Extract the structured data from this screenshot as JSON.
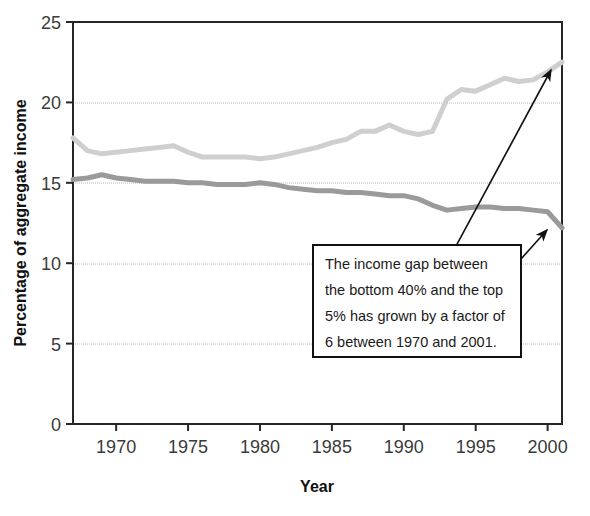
{
  "chart_data": {
    "type": "line",
    "title": "",
    "xlabel": "Year",
    "ylabel": "Percentage of aggregate income",
    "xlim": [
      1967,
      2001
    ],
    "ylim": [
      0,
      25
    ],
    "yticks": [
      0,
      5,
      10,
      15,
      20,
      25
    ],
    "ytick_labels": [
      "0",
      "5",
      "10",
      "15",
      "20",
      "25"
    ],
    "xticks": [
      1970,
      1975,
      1980,
      1985,
      1990,
      1995,
      2000
    ],
    "xtick_labels": [
      "1970",
      "1975",
      "1980",
      "1985",
      "1990",
      "1995",
      "2000"
    ],
    "grid": "horizontal-dotted",
    "legend": "none",
    "x": [
      1967,
      1968,
      1969,
      1970,
      1971,
      1972,
      1973,
      1974,
      1975,
      1976,
      1977,
      1978,
      1979,
      1980,
      1981,
      1982,
      1983,
      1984,
      1985,
      1986,
      1987,
      1988,
      1989,
      1990,
      1991,
      1992,
      1993,
      1994,
      1995,
      1996,
      1997,
      1998,
      1999,
      2000,
      2001
    ],
    "series": [
      {
        "name": "top-5-percent",
        "color": "#cfcfcf",
        "values": [
          17.8,
          17.0,
          16.8,
          16.9,
          17.0,
          17.1,
          17.2,
          17.3,
          16.9,
          16.6,
          16.6,
          16.6,
          16.6,
          16.5,
          16.6,
          16.8,
          17.0,
          17.2,
          17.5,
          17.7,
          18.2,
          18.2,
          18.6,
          18.2,
          18.0,
          18.2,
          20.2,
          20.8,
          20.7,
          21.1,
          21.5,
          21.3,
          21.4,
          21.9,
          22.5
        ]
      },
      {
        "name": "bottom-40-percent",
        "color": "#9a9a9a",
        "values": [
          15.2,
          15.3,
          15.5,
          15.3,
          15.2,
          15.1,
          15.1,
          15.1,
          15.0,
          15.0,
          14.9,
          14.9,
          14.9,
          15.0,
          14.9,
          14.7,
          14.6,
          14.5,
          14.5,
          14.4,
          14.4,
          14.3,
          14.2,
          14.2,
          14.0,
          13.6,
          13.3,
          13.4,
          13.5,
          13.5,
          13.4,
          13.4,
          13.3,
          13.2,
          12.2
        ]
      }
    ],
    "annotation": {
      "line1": "The income gap between",
      "line2": "the bottom 40% and the top",
      "line3": "5% has grown by a factor of",
      "line4": "6 between 1970 and 2001.",
      "arrow_top_target": "top-5-percent-end",
      "arrow_bottom_target": "bottom-40-percent-end"
    }
  }
}
